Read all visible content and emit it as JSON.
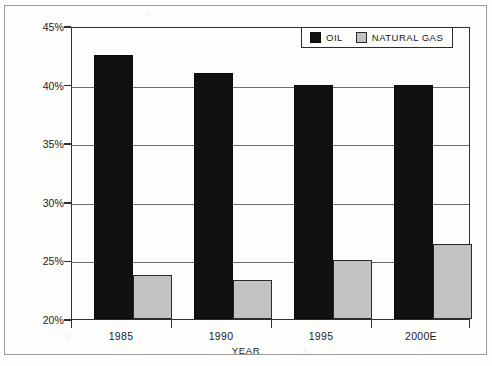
{
  "chart_data": {
    "type": "bar",
    "title": "",
    "xlabel": "YEAR",
    "ylabel": "",
    "categories": [
      "1985",
      "1990",
      "1995",
      "2000E"
    ],
    "series": [
      {
        "name": "OIL",
        "color": "#111111",
        "values": [
          42.5,
          41.0,
          40.0,
          40.0
        ]
      },
      {
        "name": "NATURAL GAS",
        "color": "#c2c2c2",
        "values": [
          23.8,
          23.3,
          25.0,
          26.4
        ]
      }
    ],
    "ylim": [
      20,
      45
    ],
    "ytick_values": [
      20,
      25,
      30,
      35,
      40,
      45
    ],
    "ytick_labels": [
      "20%",
      "25%",
      "30%",
      "35%",
      "40%",
      "45%"
    ],
    "grid": true,
    "legend_position": "top-right",
    "value_unit": "%"
  },
  "legend": {
    "entries": [
      {
        "label": "OIL",
        "swatch": "black-square"
      },
      {
        "label": "NATURAL GAS",
        "swatch": "gray-square"
      }
    ]
  },
  "axis": {
    "x_title": "YEAR"
  }
}
